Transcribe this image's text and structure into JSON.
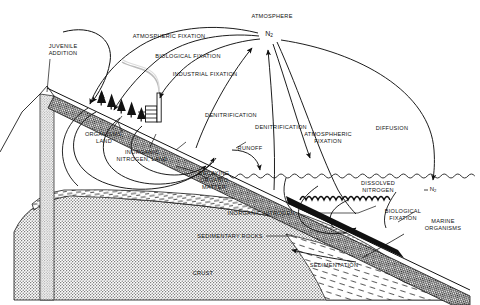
{
  "diagram": {
    "type": "earth-science-schematic",
    "colors": {
      "ink": "#111111",
      "background": "#ffffff",
      "crust_fill": "#b8b8b8",
      "sediment_fill": "#ffffff",
      "seafloor_fill": "#3a3a3a",
      "vent_fill": "#9a9a9a"
    }
  },
  "reservoirs": {
    "atmosphere": "ATMOSPHERE",
    "n2_atmospheric": "N",
    "n2_atmospheric_sub": "2",
    "n2_dissolved_marker": "N",
    "n2_dissolved_marker_sub": "2",
    "organisms_land": "ORGANISMS,\nLAND",
    "inorganic_nitrogen_land": "INORGANIC\nNITROGEN, LAND",
    "decaying_organic_matter": "DECAYING\nORGANIC\nMATTER",
    "dissolved_nitrogen": "DISSOLVED\nNITROGEN",
    "marine_organisms": "MARINE\nORGANISMS",
    "inorganic_nitrogen_marine": "INORGANIC NITROGEN,",
    "sedimentary_rocks": "SEDIMENTARY ROCKS",
    "crust": "CRUST"
  },
  "processes": {
    "juvenile_addition": "JUVENILE\nADDITION",
    "atmospheric_fixation_land": "ATMOSPHERIC FIXATION",
    "biological_fixation_land": "BIOLOGICAL FIXATION",
    "industrial_fixation": "INDUSTRIAL FIXATION",
    "denitrification_land": "DENITRIFICATION",
    "denitrification_marine": "DENITRIFICATION",
    "atmospheric_fixation_marine": "ATMOSPHHERIC\nFIXATION",
    "diffusion": "DIFFUSION",
    "runoff": "RUNOFF",
    "biological_fixation_marine": "BIOLOGICAL\nFIXATION",
    "sedimentation": "SEDIMENTATION"
  },
  "label_positions": {
    "atmosphere": {
      "x": 272,
      "y": 13,
      "align": "center"
    },
    "n2_atmospheric": {
      "x": 269,
      "y": 31,
      "align": "center"
    },
    "n2_dissolved_marker": {
      "x": 433,
      "y": 190,
      "align": "center"
    },
    "juvenile_addition": {
      "x": 63,
      "y": 47,
      "align": "center"
    },
    "atmospheric_fixation_land": {
      "x": 169,
      "y": 35,
      "align": "center"
    },
    "biological_fixation_land": {
      "x": 188,
      "y": 55,
      "align": "center"
    },
    "industrial_fixation": {
      "x": 203,
      "y": 73,
      "align": "center"
    },
    "denitrification_land": {
      "x": 230,
      "y": 115,
      "align": "center"
    },
    "denitrification_marine": {
      "x": 280,
      "y": 126,
      "align": "center"
    },
    "atmospheric_fixation_marine": {
      "x": 327,
      "y": 133,
      "align": "center"
    },
    "diffusion": {
      "x": 391,
      "y": 127,
      "align": "center"
    },
    "runoff": {
      "x": 250,
      "y": 148,
      "align": "center"
    },
    "organisms_land": {
      "x": 104,
      "y": 134,
      "align": "center"
    },
    "inorganic_nitrogen_land": {
      "x": 141,
      "y": 152,
      "align": "center"
    },
    "decaying_organic_matter": {
      "x": 213,
      "y": 173,
      "align": "center"
    },
    "dissolved_nitrogen": {
      "x": 377,
      "y": 183,
      "align": "center"
    },
    "biological_fixation_marine": {
      "x": 403,
      "y": 211,
      "align": "center"
    },
    "marine_organisms": {
      "x": 443,
      "y": 220,
      "align": "center"
    },
    "inorganic_nitrogen_marine": {
      "x": 262,
      "y": 213,
      "align": "center"
    },
    "sedimentary_rocks": {
      "x": 237,
      "y": 236,
      "align": "center"
    },
    "sedimentation": {
      "x": 333,
      "y": 265,
      "align": "center"
    },
    "crust": {
      "x": 202,
      "y": 273,
      "align": "center"
    }
  }
}
